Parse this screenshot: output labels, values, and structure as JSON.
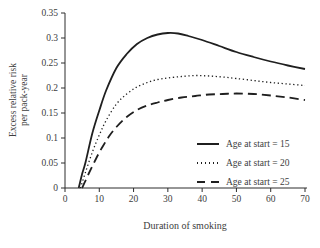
{
  "figure": {
    "background": "#ffffff",
    "text_color": "#3d3d3d",
    "line_color": "#1f1f1f"
  },
  "chart_data": {
    "type": "line",
    "title": "",
    "xlabel": "Duration of smoking",
    "ylabel": "Excess relative risk per pack-year",
    "ylabel_lines": [
      "Excess relative risk",
      "per pack-year"
    ],
    "xlim": [
      0,
      70
    ],
    "ylim": [
      0,
      0.35
    ],
    "x_ticks": [
      0,
      10,
      20,
      30,
      40,
      50,
      60,
      70
    ],
    "x_tick_labels": [
      "0",
      "10",
      "20",
      "30",
      "40",
      "50",
      "60",
      "70"
    ],
    "y_ticks": [
      0,
      0.05,
      0.1,
      0.15,
      0.2,
      0.25,
      0.3,
      0.35
    ],
    "y_tick_labels": [
      "0",
      "0.05",
      "0.1",
      "0.15",
      "0.2",
      "0.25",
      "0.3",
      "0.35"
    ],
    "grid": false,
    "legend_position": "inside-lower-right",
    "series": [
      {
        "name": "Age at start = 15",
        "style": "solid",
        "points": [
          [
            4,
            0
          ],
          [
            5,
            0.028
          ],
          [
            6,
            0.052
          ],
          [
            8,
            0.11
          ],
          [
            10,
            0.155
          ],
          [
            12,
            0.195
          ],
          [
            15,
            0.24
          ],
          [
            18,
            0.268
          ],
          [
            21,
            0.288
          ],
          [
            24,
            0.3
          ],
          [
            27,
            0.307
          ],
          [
            30,
            0.31
          ],
          [
            33,
            0.309
          ],
          [
            36,
            0.304
          ],
          [
            40,
            0.296
          ],
          [
            45,
            0.284
          ],
          [
            50,
            0.272
          ],
          [
            55,
            0.262
          ],
          [
            60,
            0.253
          ],
          [
            65,
            0.245
          ],
          [
            70,
            0.238
          ]
        ]
      },
      {
        "name": "Age at start = 20",
        "style": "dotted",
        "points": [
          [
            4.5,
            0
          ],
          [
            6,
            0.032
          ],
          [
            8,
            0.072
          ],
          [
            10,
            0.106
          ],
          [
            12,
            0.135
          ],
          [
            15,
            0.168
          ],
          [
            18,
            0.188
          ],
          [
            21,
            0.202
          ],
          [
            24,
            0.211
          ],
          [
            27,
            0.217
          ],
          [
            30,
            0.22
          ],
          [
            34,
            0.223
          ],
          [
            38,
            0.225
          ],
          [
            42,
            0.224
          ],
          [
            46,
            0.222
          ],
          [
            50,
            0.219
          ],
          [
            55,
            0.215
          ],
          [
            60,
            0.211
          ],
          [
            65,
            0.208
          ],
          [
            70,
            0.205
          ]
        ]
      },
      {
        "name": "Age at start = 25",
        "style": "dashed",
        "points": [
          [
            5,
            0
          ],
          [
            7,
            0.03
          ],
          [
            9,
            0.058
          ],
          [
            11,
            0.083
          ],
          [
            13,
            0.105
          ],
          [
            15,
            0.122
          ],
          [
            18,
            0.142
          ],
          [
            21,
            0.156
          ],
          [
            24,
            0.165
          ],
          [
            27,
            0.171
          ],
          [
            30,
            0.176
          ],
          [
            34,
            0.181
          ],
          [
            38,
            0.184
          ],
          [
            42,
            0.187
          ],
          [
            46,
            0.188
          ],
          [
            50,
            0.189
          ],
          [
            55,
            0.188
          ],
          [
            60,
            0.185
          ],
          [
            65,
            0.181
          ],
          [
            70,
            0.176
          ]
        ]
      }
    ]
  }
}
